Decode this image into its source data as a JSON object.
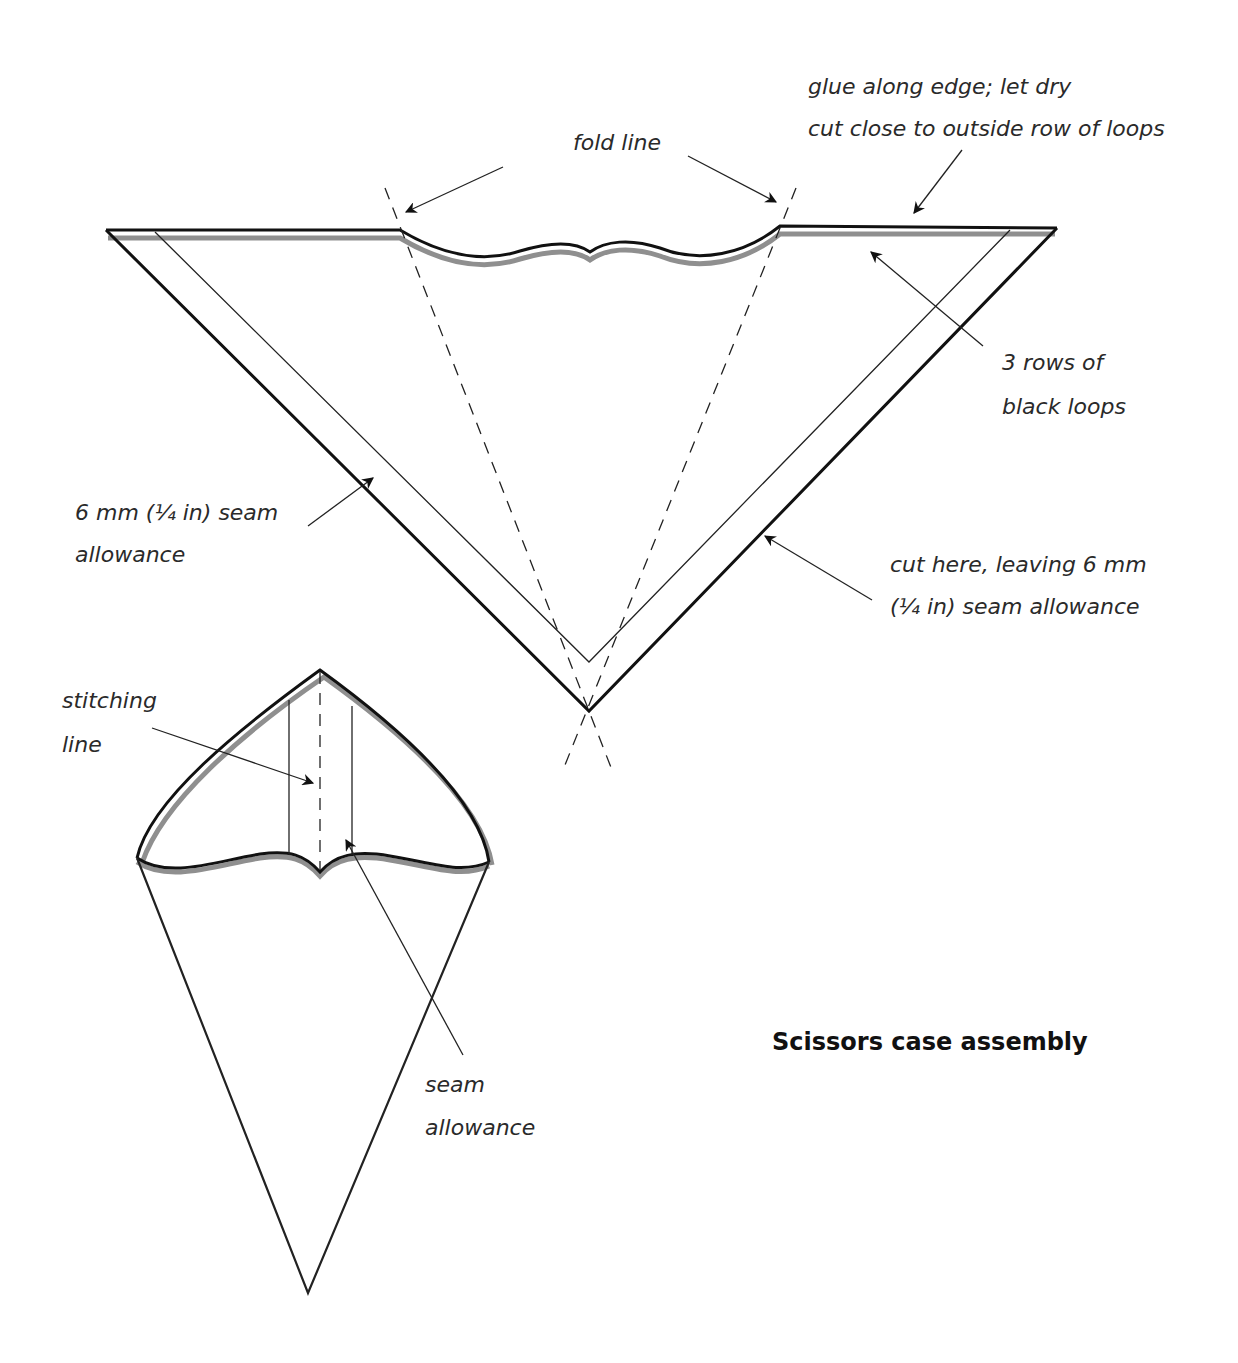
{
  "title": "Scissors case assembly",
  "labels": {
    "glue": "glue along edge; let dry",
    "cut_close": "cut close to outside row of loops",
    "fold_line": "fold line",
    "rows_line1": "3 rows of",
    "rows_line2": "black loops",
    "seam_left_line1": "6 mm (¼ in) seam",
    "seam_left_line2": "allowance",
    "cut_here_line1": "cut here, leaving 6 mm",
    "cut_here_line2": "(¼ in) seam allowance",
    "stitching_line1": "stitching",
    "stitching_line2": "line",
    "seam_bottom_line1": "seam",
    "seam_bottom_line2": "allowance"
  },
  "colors": {
    "line": "#111111",
    "shadow": "#8f8f8f",
    "text": "#2a2a2a",
    "background": "#ffffff"
  },
  "figures": [
    {
      "name": "flat-pattern",
      "description": "Flat triangular pattern with wavy top edge and dashed fold lines"
    },
    {
      "name": "assembled-cone",
      "description": "Assembled cone-shaped scissors case with stitching line"
    }
  ]
}
